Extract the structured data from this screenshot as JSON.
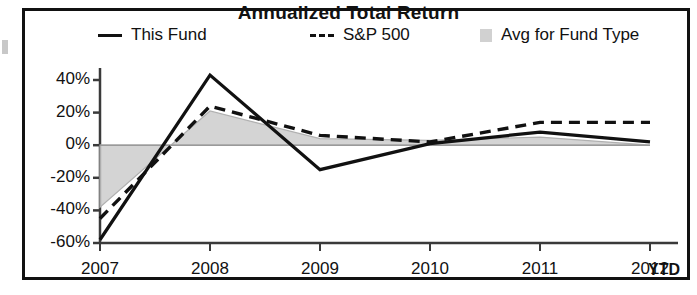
{
  "chart_data": {
    "type": "line",
    "title": "Annualized Total Return",
    "xlabel": "",
    "ylabel": "",
    "x_note": "YTD",
    "categories": [
      "2007",
      "2008",
      "2009",
      "2010",
      "2011",
      "2012"
    ],
    "ytick_labels": [
      "40%",
      "20%",
      "0%",
      "-20%",
      "-40%",
      "-60%"
    ],
    "yticks": [
      40,
      20,
      0,
      -20,
      -40,
      -60
    ],
    "ylim": [
      -60,
      48
    ],
    "grid": false,
    "legend_position": "top",
    "series": [
      {
        "name": "This Fund",
        "style": "solid",
        "color": "#111111",
        "values": [
          -58,
          43,
          -15,
          1,
          8,
          2
        ]
      },
      {
        "name": "S&P 500",
        "style": "dashed",
        "color": "#111111",
        "values": [
          -45,
          24,
          6,
          2,
          14,
          14
        ]
      },
      {
        "name": "Avg for Fund Type",
        "style": "area",
        "color": "#c9c9c9",
        "values": [
          -38,
          21,
          4,
          3,
          5,
          0
        ]
      }
    ]
  },
  "legend": {
    "fund_label": "This Fund",
    "sp500_label": "S&P 500",
    "avg_label": "Avg for Fund Type"
  },
  "axis": {
    "ytd_label": "YTD"
  }
}
